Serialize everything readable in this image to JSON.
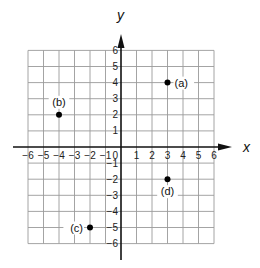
{
  "chart_data": {
    "type": "scatter",
    "title": "",
    "xlabel": "x",
    "ylabel": "y",
    "xlim": [
      -6,
      6
    ],
    "ylim": [
      -6,
      6
    ],
    "grid": true,
    "x_ticks": [
      -6,
      -5,
      -4,
      -3,
      -2,
      -1,
      1,
      2,
      3,
      4,
      5,
      6
    ],
    "y_ticks": [
      -6,
      -5,
      -4,
      -3,
      -2,
      -1,
      1,
      2,
      3,
      4,
      5,
      6
    ],
    "origin_label": "0",
    "points": [
      {
        "label": "(a)",
        "x": 3,
        "y": 4
      },
      {
        "label": "(b)",
        "x": -4,
        "y": 2
      },
      {
        "label": "(c)",
        "x": -2,
        "y": -5
      },
      {
        "label": "(d)",
        "x": 3,
        "y": -2
      }
    ]
  },
  "colors": {
    "grid": "#9a9a9a",
    "axis": "#111111",
    "point": "#000000"
  }
}
